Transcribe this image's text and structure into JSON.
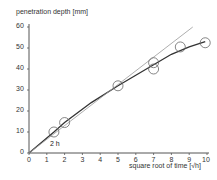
{
  "chart_data": {
    "type": "scatter",
    "title": "",
    "ylabel": "penetration depth [mm]",
    "xlabel": "square root of time [√h]",
    "xlim": [
      0,
      10
    ],
    "ylim": [
      0,
      60
    ],
    "x_ticks": [
      "0",
      "1",
      "2",
      "3",
      "4",
      "5",
      "6",
      "7",
      "8",
      "9",
      "10"
    ],
    "y_ticks": [
      "0",
      "10",
      "20",
      "30",
      "40",
      "50",
      "60"
    ],
    "grid": false,
    "legend": null,
    "annotations": [
      {
        "text": "2 h",
        "x": 1.4,
        "y": 5
      }
    ],
    "series": [
      {
        "name": "measured",
        "type": "scatter",
        "marker": "open-circle",
        "x": [
          1.4,
          2.0,
          5.0,
          7.0,
          7.0,
          8.5,
          9.9
        ],
        "y": [
          10,
          14.5,
          32,
          40,
          43,
          50.5,
          52.5
        ]
      },
      {
        "name": "fitted curve",
        "type": "line",
        "color": "#333333",
        "x": [
          0,
          1.4,
          2.0,
          3.5,
          5.0,
          6.0,
          7.0,
          8.0,
          9.0,
          9.9
        ],
        "y": [
          0,
          10,
          14.5,
          24,
          32,
          37,
          42,
          47,
          50.5,
          53
        ]
      },
      {
        "name": "linear reference",
        "type": "line",
        "color": "#999999",
        "x": [
          0,
          9.2
        ],
        "y": [
          0,
          60
        ]
      }
    ]
  }
}
